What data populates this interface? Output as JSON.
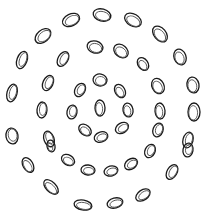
{
  "image": {
    "width": 203,
    "height": 219,
    "background": "#ffffff",
    "stroke_color": "#1a1a1a",
    "inner_stroke_color": "#555555",
    "description": "Concentric rings of double-outlined ovals (optical illusion pattern)"
  },
  "ovals": [
    {
      "cx": 71,
      "cy": 20,
      "rx": 9,
      "ry": 6,
      "rot": -25
    },
    {
      "cx": 102,
      "cy": 15,
      "rx": 9,
      "ry": 6,
      "rot": 15
    },
    {
      "cx": 133,
      "cy": 20,
      "rx": 9,
      "ry": 6,
      "rot": 30
    },
    {
      "cx": 160,
      "cy": 34,
      "rx": 9,
      "ry": 6,
      "rot": 50
    },
    {
      "cx": 43,
      "cy": 36,
      "rx": 9,
      "ry": 6,
      "rot": -40
    },
    {
      "cx": 22,
      "cy": 60,
      "rx": 9,
      "ry": 5,
      "rot": -70
    },
    {
      "cx": 63,
      "cy": 59,
      "rx": 8,
      "ry": 5,
      "rot": -60
    },
    {
      "cx": 95,
      "cy": 47,
      "rx": 8,
      "ry": 6,
      "rot": 15
    },
    {
      "cx": 121,
      "cy": 51,
      "rx": 8,
      "ry": 6,
      "rot": 40
    },
    {
      "cx": 143,
      "cy": 64,
      "rx": 7,
      "ry": 5,
      "rot": 55
    },
    {
      "cx": 180,
      "cy": 57,
      "rx": 8,
      "ry": 6,
      "rot": 70
    },
    {
      "cx": 12,
      "cy": 93,
      "rx": 9,
      "ry": 5,
      "rot": -75
    },
    {
      "cx": 48,
      "cy": 83,
      "rx": 8,
      "ry": 5,
      "rot": -65
    },
    {
      "cx": 80,
      "cy": 90,
      "rx": 7,
      "ry": 5,
      "rot": -60
    },
    {
      "cx": 100,
      "cy": 80,
      "rx": 7,
      "ry": 6,
      "rot": 10
    },
    {
      "cx": 120,
      "cy": 91,
      "rx": 7,
      "ry": 5,
      "rot": 60
    },
    {
      "cx": 158,
      "cy": 86,
      "rx": 8,
      "ry": 6,
      "rot": 65
    },
    {
      "cx": 193,
      "cy": 85,
      "rx": 8,
      "ry": 6,
      "rot": 80
    },
    {
      "cx": 42,
      "cy": 110,
      "rx": 8,
      "ry": 5,
      "rot": -85
    },
    {
      "cx": 72,
      "cy": 112,
      "rx": 7,
      "ry": 5,
      "rot": -80
    },
    {
      "cx": 100,
      "cy": 108,
      "rx": 8,
      "ry": 5,
      "rot": 88
    },
    {
      "cx": 128,
      "cy": 110,
      "rx": 7,
      "ry": 5,
      "rot": 80
    },
    {
      "cx": 160,
      "cy": 111,
      "rx": 8,
      "ry": 5,
      "rot": 85
    },
    {
      "cx": 194,
      "cy": 112,
      "rx": 9,
      "ry": 6,
      "rot": 90
    },
    {
      "cx": 12,
      "cy": 136,
      "rx": 8,
      "ry": 6,
      "rot": -100
    },
    {
      "cx": 49,
      "cy": 139,
      "rx": 8,
      "ry": 5,
      "rot": -110
    },
    {
      "cx": 85,
      "cy": 130,
      "rx": 7,
      "ry": 5,
      "rot": 40
    },
    {
      "cx": 101,
      "cy": 137,
      "rx": 7,
      "ry": 5,
      "rot": -20
    },
    {
      "cx": 122,
      "cy": 128,
      "rx": 7,
      "ry": 5,
      "rot": -30
    },
    {
      "cx": 158,
      "cy": 130,
      "rx": 7,
      "ry": 5,
      "rot": -70
    },
    {
      "cx": 188,
      "cy": 140,
      "rx": 8,
      "ry": 5,
      "rot": -75
    },
    {
      "cx": 51,
      "cy": 146,
      "rx": 6,
      "ry": 4,
      "rot": 80
    },
    {
      "cx": 150,
      "cy": 151,
      "rx": 7,
      "ry": 5,
      "rot": -65
    },
    {
      "cx": 188,
      "cy": 150,
      "rx": 7,
      "ry": 5,
      "rot": -80
    },
    {
      "cx": 28,
      "cy": 165,
      "rx": 8,
      "ry": 5,
      "rot": 60
    },
    {
      "cx": 68,
      "cy": 160,
      "rx": 7,
      "ry": 5,
      "rot": 30
    },
    {
      "cx": 88,
      "cy": 170,
      "rx": 7,
      "ry": 5,
      "rot": 5
    },
    {
      "cx": 111,
      "cy": 171,
      "rx": 7,
      "ry": 5,
      "rot": -15
    },
    {
      "cx": 131,
      "cy": 164,
      "rx": 7,
      "ry": 5,
      "rot": -35
    },
    {
      "cx": 172,
      "cy": 172,
      "rx": 8,
      "ry": 5,
      "rot": -60
    },
    {
      "cx": 51,
      "cy": 187,
      "rx": 9,
      "ry": 5,
      "rot": 45
    },
    {
      "cx": 143,
      "cy": 195,
      "rx": 8,
      "ry": 5,
      "rot": -35
    },
    {
      "cx": 83,
      "cy": 205,
      "rx": 9,
      "ry": 5,
      "rot": 10
    },
    {
      "cx": 115,
      "cy": 203,
      "rx": 8,
      "ry": 5,
      "rot": -15
    }
  ]
}
